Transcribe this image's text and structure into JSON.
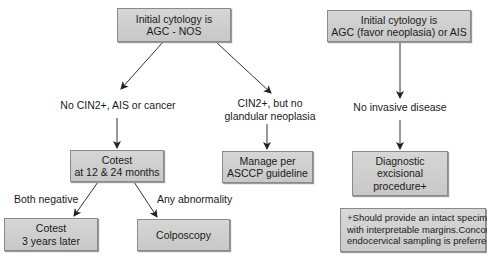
{
  "left_flow": {
    "start": {
      "line1": "Initial cytology is",
      "line2": "AGC - NOS"
    },
    "branch_a_label": "No CIN2+, AIS or cancer",
    "branch_b_label": {
      "line1": "CIN2+, but no",
      "line2": "glandular neoplasia"
    },
    "cotest": {
      "line1": "Cotest",
      "line2": "at 12 & 24 months"
    },
    "manage": {
      "line1": "Manage per",
      "line2": "ASCCP guideline"
    },
    "both_negative_label": "Both negative",
    "any_abnormality_label": "Any abnormality",
    "cotest_later": {
      "line1": "Cotest",
      "line2": "3 years later"
    },
    "colposcopy": "Colposcopy"
  },
  "right_flow": {
    "start": {
      "line1": "Initial cytology is",
      "line2": "AGC (favor neoplasia) or AIS"
    },
    "branch_label": "No invasive disease",
    "excisional": {
      "line1": "Diagnostic",
      "line2": "excisional",
      "line3": "procedure+"
    },
    "footnote": {
      "line1": "+Should provide an intact specimen",
      "line2": "with interpretable margins.Concomitant",
      "line3": "endocervical sampling is preferred"
    }
  },
  "colors": {
    "box_fill": "#cfcfcf",
    "box_border": "#8a8a8a",
    "arrow": "#222222"
  }
}
